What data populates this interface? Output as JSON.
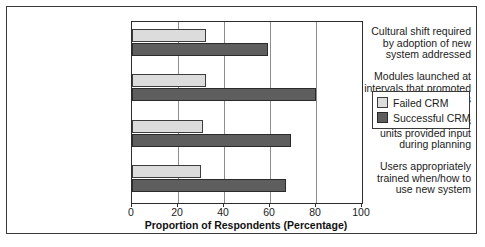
{
  "chart_data": {
    "type": "bar",
    "orientation": "horizontal",
    "title": "",
    "xlabel": "Proportion of Respondents (Percentage)",
    "ylabel": "",
    "xlim": [
      0,
      100
    ],
    "xticks": [
      0,
      20,
      40,
      60,
      80,
      100
    ],
    "xticklabels": [
      "0",
      "20",
      "40",
      "60",
      "80",
      "100"
    ],
    "grid": "vertical",
    "legend_position": "right",
    "categories": [
      "Cultural shift required by adoption of new system addressed",
      "Modules launched at intervals that promoted adoption by users",
      "All affected business units provided input during planning",
      "Users appropriately trained when/how to use new system"
    ],
    "category_lines": [
      [
        "Cultural shift required",
        "by adoption of new",
        "system addressed"
      ],
      [
        "Modules launched at",
        "intervals that promoted",
        "adoption by users"
      ],
      [
        "All affected business",
        "units provided input",
        "during planning"
      ],
      [
        "Users appropriately",
        "trained when/how to",
        "use new system"
      ]
    ],
    "series": [
      {
        "name": "Failed CRM",
        "color": "#dcdcdc",
        "values": [
          32,
          32,
          31,
          30
        ]
      },
      {
        "name": "Successful CRM",
        "color": "#5e5e5e",
        "values": [
          59,
          80,
          69,
          67
        ]
      }
    ]
  },
  "legend": {
    "items": [
      {
        "label": "Failed CRM"
      },
      {
        "label": "Successful CRM"
      }
    ]
  }
}
